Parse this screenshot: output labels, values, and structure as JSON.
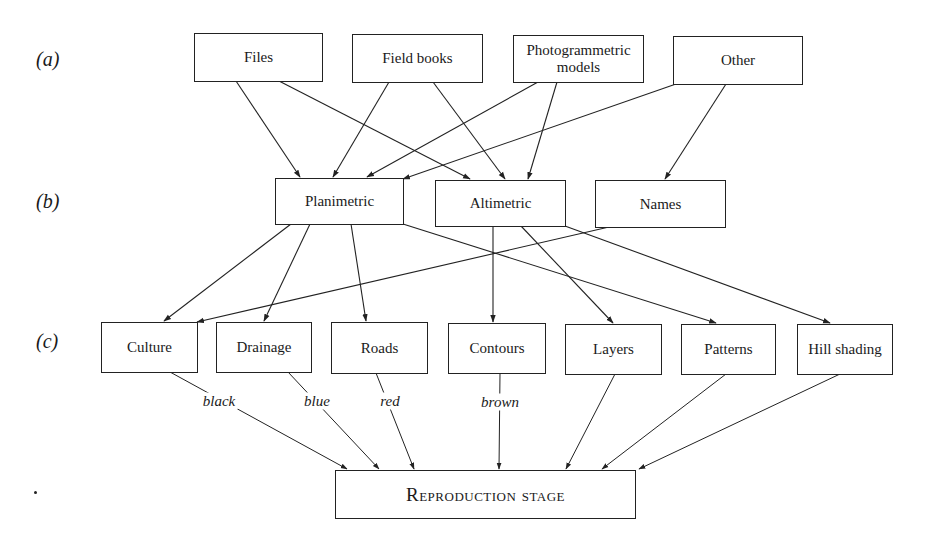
{
  "diagram": {
    "row_labels": {
      "a": "(a)",
      "b": "(b)",
      "c": "(c)"
    },
    "sources": [
      {
        "id": "files",
        "label": "Files"
      },
      {
        "id": "field_books",
        "label": "Field books"
      },
      {
        "id": "photogrammetric",
        "label": "Photogrammetric models"
      },
      {
        "id": "other",
        "label": "Other"
      }
    ],
    "categories": [
      {
        "id": "planimetric",
        "label": "Planimetric"
      },
      {
        "id": "altimetric",
        "label": "Altimetric"
      },
      {
        "id": "names",
        "label": "Names"
      }
    ],
    "layers": [
      {
        "id": "culture",
        "label": "Culture",
        "color": "black"
      },
      {
        "id": "drainage",
        "label": "Drainage",
        "color": "blue"
      },
      {
        "id": "roads",
        "label": "Roads",
        "color": "red"
      },
      {
        "id": "contours",
        "label": "Contours",
        "color": "brown"
      },
      {
        "id": "layers",
        "label": "Layers"
      },
      {
        "id": "patterns",
        "label": "Patterns"
      },
      {
        "id": "hill_shading",
        "label": "Hill shading"
      }
    ],
    "output": {
      "id": "reproduction",
      "label": "Reproduction stage"
    },
    "edges": [
      [
        "files",
        "planimetric"
      ],
      [
        "files",
        "altimetric"
      ],
      [
        "field_books",
        "planimetric"
      ],
      [
        "field_books",
        "altimetric"
      ],
      [
        "photogrammetric",
        "planimetric"
      ],
      [
        "photogrammetric",
        "altimetric"
      ],
      [
        "other",
        "planimetric"
      ],
      [
        "other",
        "names"
      ],
      [
        "planimetric",
        "culture"
      ],
      [
        "planimetric",
        "drainage"
      ],
      [
        "planimetric",
        "roads"
      ],
      [
        "planimetric",
        "patterns"
      ],
      [
        "altimetric",
        "contours"
      ],
      [
        "altimetric",
        "layers"
      ],
      [
        "altimetric",
        "hill_shading"
      ],
      [
        "names",
        "culture"
      ],
      [
        "culture",
        "reproduction"
      ],
      [
        "drainage",
        "reproduction"
      ],
      [
        "roads",
        "reproduction"
      ],
      [
        "contours",
        "reproduction"
      ],
      [
        "layers",
        "reproduction"
      ],
      [
        "patterns",
        "reproduction"
      ],
      [
        "hill_shading",
        "reproduction"
      ]
    ]
  }
}
